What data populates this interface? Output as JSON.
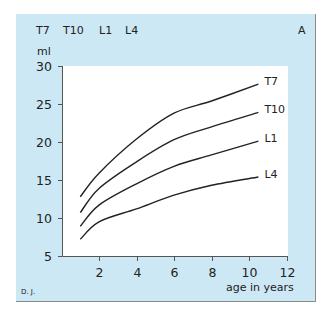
{
  "header": {
    "legend_labels": [
      "T7",
      "T10",
      "L1",
      "L4"
    ],
    "panel_letter": "A"
  },
  "credit": "D. J.",
  "chart_data": {
    "type": "line",
    "title": "",
    "xlabel": "age in years",
    "ylabel": "ml",
    "xlim": [
      0,
      12
    ],
    "ylim": [
      5,
      30
    ],
    "xticks": [
      2,
      4,
      6,
      8,
      10,
      12
    ],
    "yticks": [
      5,
      10,
      15,
      20,
      25,
      30
    ],
    "grid": false,
    "legend_position": "top-left (text list) and inline labels at line ends",
    "x": [
      1,
      2,
      4,
      6,
      8,
      10.5
    ],
    "series": [
      {
        "name": "T7",
        "values": [
          12.8,
          15.9,
          20.4,
          23.8,
          25.4,
          27.6
        ]
      },
      {
        "name": "T10",
        "values": [
          10.7,
          13.9,
          17.4,
          20.3,
          22.0,
          23.9
        ]
      },
      {
        "name": "L1",
        "values": [
          8.9,
          11.7,
          14.5,
          16.8,
          18.3,
          20.1
        ]
      },
      {
        "name": "L4",
        "values": [
          7.2,
          9.5,
          11.2,
          13.0,
          14.3,
          15.4
        ]
      }
    ],
    "colors": {
      "panel_bg": "#cde8f5",
      "plot_bg": "#ffffff",
      "line": "#222222",
      "border": "#8a8a8a"
    }
  }
}
